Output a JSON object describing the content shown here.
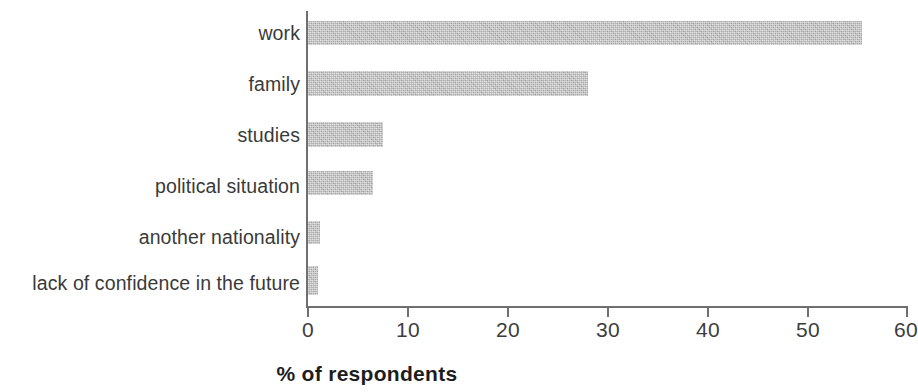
{
  "chart_data": {
    "type": "bar",
    "orientation": "horizontal",
    "title": "",
    "subtitle": "",
    "xlabel": "% of respondents",
    "ylabel": "",
    "xlim": [
      0,
      60
    ],
    "xticks": [
      0,
      10,
      20,
      30,
      40,
      50,
      60
    ],
    "xtick_labels": [
      "0",
      "10",
      "20",
      "30",
      "40",
      "50",
      "60"
    ],
    "grid": false,
    "legend": false,
    "bar_color": "#b8b8b8",
    "axis_color": "#6f6f6f",
    "categories": [
      "work",
      "family",
      "studies",
      "political situation",
      "another nationality",
      "lack of confidence in the future"
    ],
    "values": [
      55.5,
      28.0,
      7.5,
      6.5,
      1.2,
      1.0
    ],
    "series": [
      {
        "name": "% of respondents",
        "values": [
          55.5,
          28.0,
          7.5,
          6.5,
          1.2,
          1.0
        ]
      }
    ]
  }
}
